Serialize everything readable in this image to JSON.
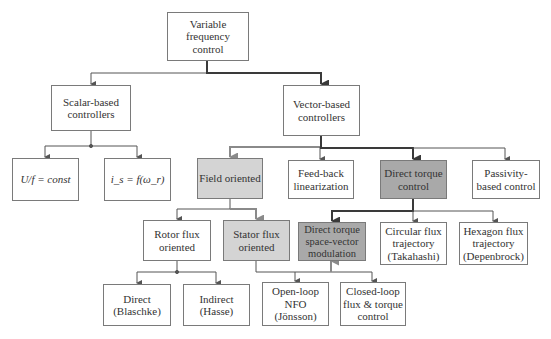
{
  "diagram": {
    "colors": {
      "line": "#555555",
      "line_heavy": "#3a3a3a",
      "line_gray": "#8a8a8a",
      "box_border": "#7a7a7a",
      "fill_light": "#d4d4d4",
      "fill_dark": "#a9a9a9"
    },
    "nodes": {
      "root": {
        "label": "Variable\nfrequency\ncontrol"
      },
      "scalar": {
        "label": "Scalar-based\ncontrollers"
      },
      "vector": {
        "label": "Vector-based\ncontrollers"
      },
      "uf_const": {
        "label": "U/f = const"
      },
      "is_f_wr": {
        "label": "i_s = f(ω_r)"
      },
      "field_oriented": {
        "label": "Field oriented"
      },
      "feedback_lin": {
        "label": "Feed-back\nlinearization"
      },
      "dtc": {
        "label": "Direct torque\ncontrol"
      },
      "passivity": {
        "label": "Passivity-\nbased control"
      },
      "rotor_flux": {
        "label": "Rotor flux\noriented"
      },
      "stator_flux": {
        "label": "Stator flux\noriented"
      },
      "dtsvm": {
        "label": "Direct torque\nspace-vector\nmodulation"
      },
      "circular_flux": {
        "label": "Circular flux\ntrajectory\n(Takahashi)"
      },
      "hexagon_flux": {
        "label": "Hexagon flux\ntrajectory\n(Depenbrock)"
      },
      "direct": {
        "label": "Direct\n(Blaschke)"
      },
      "indirect": {
        "label": "Indirect\n(Hasse)"
      },
      "open_loop_nfo": {
        "label": "Open-loop\nNFO\n(Jönsson)"
      },
      "closed_loop": {
        "label": "Closed-loop\nflux & torque\ncontrol"
      }
    },
    "edges": [
      {
        "from": "root",
        "to": "scalar"
      },
      {
        "from": "root",
        "to": "vector",
        "style": "heavy"
      },
      {
        "from": "scalar",
        "to": "uf_const"
      },
      {
        "from": "scalar",
        "to": "is_f_wr"
      },
      {
        "from": "vector",
        "to": "field_oriented",
        "style": "gray"
      },
      {
        "from": "vector",
        "to": "feedback_lin"
      },
      {
        "from": "vector",
        "to": "dtc",
        "style": "heavy"
      },
      {
        "from": "vector",
        "to": "passivity"
      },
      {
        "from": "field_oriented",
        "to": "rotor_flux"
      },
      {
        "from": "field_oriented",
        "to": "stator_flux",
        "style": "gray"
      },
      {
        "from": "dtc",
        "to": "dtsvm",
        "style": "heavy"
      },
      {
        "from": "dtc",
        "to": "circular_flux"
      },
      {
        "from": "dtc",
        "to": "hexagon_flux"
      },
      {
        "from": "rotor_flux",
        "to": "direct"
      },
      {
        "from": "rotor_flux",
        "to": "indirect"
      },
      {
        "from": "stator_flux",
        "to": "open_loop_nfo"
      },
      {
        "from": "stator_flux",
        "to": "closed_loop"
      },
      {
        "from": "stator_flux",
        "to": "dtsvm",
        "style": "gray"
      }
    ]
  }
}
